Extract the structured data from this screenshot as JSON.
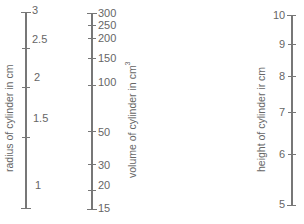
{
  "diagram": {
    "type": "nomogram",
    "scales": [
      {
        "name": "radius",
        "title": "radius of cylinder in cm",
        "labels": [
          "3",
          "2.5",
          "2",
          "1.5",
          "1"
        ]
      },
      {
        "name": "volume",
        "title": "volume of cylinder in cm",
        "title_sup": "3",
        "labels": [
          "300",
          "250",
          "200",
          "150",
          "100",
          "50",
          "30",
          "20",
          "15"
        ]
      },
      {
        "name": "height",
        "title": "height of cylinder ir cm",
        "labels": [
          "10",
          "9",
          "8",
          "7",
          "6",
          "5"
        ]
      }
    ]
  }
}
